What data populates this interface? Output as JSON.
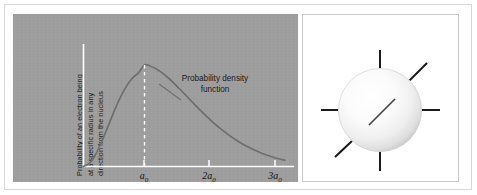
{
  "figure": {
    "background_color": "#ffffff",
    "frame_color": "#d8d8d8"
  },
  "chart_panel": {
    "background_color": "#9e9e9e",
    "axis_color": "#ffffff",
    "curve_color": "#6e6e6e",
    "dashed_line_color": "#ffffff",
    "y_axis_label_lines": [
      "Probability of an electron being",
      "at a specific radius in any",
      "direction from the nucleus"
    ],
    "annotation_lines": [
      "Probability density",
      "function"
    ],
    "x_axis_label": "Radius",
    "tick_labels": [
      {
        "base": "a",
        "sub": "0"
      },
      {
        "base": "2a",
        "sub": "0"
      },
      {
        "base": "3a",
        "sub": "0"
      }
    ]
  },
  "sphere_panel": {
    "background_color": "#ffffff",
    "border_color": "#c9c9c9",
    "sphere_highlight_color": "#ffffff",
    "sphere_shadow_color": "#c2c2c2",
    "ray_color": "#1a1a1a",
    "ray_count": 6,
    "ray_directions": [
      "up",
      "down",
      "left",
      "right",
      "upper-right-diagonal",
      "lower-left-diagonal"
    ]
  },
  "chart_data": {
    "type": "line",
    "title": "",
    "subtitle": "",
    "xlabel": "Radius",
    "ylabel": "Probability of an electron being at a specific radius in any direction from the nucleus",
    "xlim": [
      0,
      3.45
    ],
    "ylim": [
      0,
      1.08
    ],
    "grid": false,
    "legend": "none",
    "xtick_values": [
      1,
      2,
      3
    ],
    "xtick_labels": [
      "a0",
      "2a0",
      "3a0"
    ],
    "ytick_values": [],
    "ytick_labels": [],
    "annotations": [
      {
        "text": "Probability density function",
        "x": 1.75,
        "y": 0.72,
        "points_to_curve": true
      },
      {
        "type": "vertical-dashed-line",
        "x": 1.0,
        "y_from": 0.0,
        "y_to": 1.0,
        "style": "dashed",
        "color": "#ffffff"
      }
    ],
    "series": [
      {
        "name": "Radial probability density 1s",
        "color": "#6e6e6e",
        "x": [
          0.0,
          0.1,
          0.2,
          0.3,
          0.4,
          0.5,
          0.6,
          0.7,
          0.8,
          0.9,
          1.0,
          1.1,
          1.2,
          1.3,
          1.4,
          1.5,
          1.6,
          1.7,
          1.8,
          1.9,
          2.0,
          2.1,
          2.2,
          2.3,
          2.4,
          2.5,
          2.6,
          2.7,
          2.8,
          2.9,
          3.0,
          3.1,
          3.2,
          3.3
        ],
        "y": [
          0.0,
          0.033,
          0.12,
          0.246,
          0.393,
          0.541,
          0.676,
          0.787,
          0.869,
          0.922,
          1.0,
          0.988,
          0.959,
          0.918,
          0.867,
          0.81,
          0.749,
          0.687,
          0.624,
          0.563,
          0.504,
          0.448,
          0.395,
          0.346,
          0.302,
          0.261,
          0.224,
          0.191,
          0.162,
          0.136,
          0.113,
          0.093,
          0.076,
          0.062
        ]
      }
    ]
  }
}
